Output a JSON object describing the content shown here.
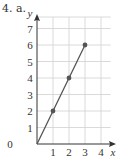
{
  "question": {
    "label": "4. a."
  },
  "chart_data": {
    "type": "line",
    "title": "",
    "xlabel": "x",
    "ylabel": "y",
    "x": [
      0,
      1,
      2,
      3
    ],
    "series": [
      {
        "name": "y = 2x",
        "values": [
          0,
          2,
          4,
          6
        ],
        "markers": [
          false,
          true,
          true,
          true
        ]
      }
    ],
    "xticks": [
      "1",
      "2",
      "3",
      "4"
    ],
    "yticks": [
      "0",
      "1",
      "2",
      "3",
      "4",
      "5",
      "6",
      "7"
    ],
    "origin_label": "0",
    "xlim": [
      0,
      4.5
    ],
    "ylim": [
      0,
      7.7
    ],
    "grid": true,
    "colors": {
      "line": "#555555",
      "marker": "#555555",
      "grid": "#d0d0d0",
      "axis": "#333333"
    }
  }
}
